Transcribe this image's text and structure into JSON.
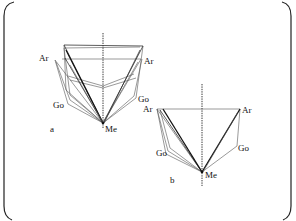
{
  "figure": {
    "panels": [
      {
        "id": "a",
        "label": "a",
        "landmarks": {
          "ar_left": "Ar",
          "ar_right": "Ar",
          "go_left": "Go",
          "go_right": "Go",
          "me": "Me"
        }
      },
      {
        "id": "b",
        "label": "b",
        "landmarks": {
          "ar_left": "Ar",
          "ar_right": "Ar",
          "go_left": "Go",
          "go_right": "Go",
          "me": "Me"
        }
      }
    ],
    "colors": {
      "line": "#333333",
      "background": "#ffffff"
    }
  }
}
